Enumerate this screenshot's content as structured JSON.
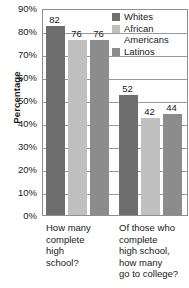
{
  "chart_data": {
    "type": "bar",
    "title": "",
    "xlabel": "",
    "ylabel": "Percentage",
    "ylim": [
      0,
      90
    ],
    "ytick_step": 10,
    "grid": true,
    "legend_position": "top-right",
    "categories": [
      "How many\ncomplete\nhigh\nschool?",
      "Of those who\ncomplete\nhigh school,\nhow many\ngo to college?"
    ],
    "ytick_labels": [
      "90%",
      "80%",
      "70%",
      "60%",
      "50%",
      "40%",
      "30%",
      "20%",
      "10%",
      "0%"
    ],
    "ytick_values": [
      90,
      80,
      70,
      60,
      50,
      40,
      30,
      20,
      10,
      0
    ],
    "series": [
      {
        "name": "Whites",
        "color": "#6e6e6e",
        "values": [
          82,
          52
        ]
      },
      {
        "name": "African\nAmericans",
        "color": "#c0c0c0",
        "values": [
          76,
          42
        ]
      },
      {
        "name": "Latinos",
        "color": "#8c8c8c",
        "values": [
          76,
          44
        ]
      }
    ],
    "value_labels": [
      "82",
      "76",
      "76",
      "52",
      "42",
      "44"
    ]
  },
  "legend": {
    "items": [
      {
        "label": "Whites",
        "color": "#6e6e6e"
      },
      {
        "label": "African\nAmericans",
        "color": "#c0c0c0"
      },
      {
        "label": "Latinos",
        "color": "#8c8c8c"
      }
    ]
  },
  "axes": {
    "y_title": "Percentage"
  }
}
